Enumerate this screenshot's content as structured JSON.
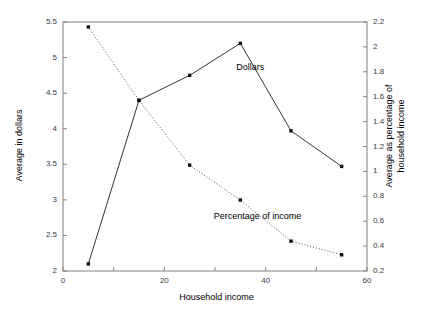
{
  "chart_data": {
    "type": "line",
    "title": "",
    "xlabel": "Household income",
    "ylabel": "Average in dollars",
    "ylabel_right": "Average as percentage of household income",
    "x": [
      5,
      15,
      25,
      35,
      45,
      55
    ],
    "xlim": [
      0,
      60
    ],
    "xticks": [
      0,
      20,
      40,
      60
    ],
    "xtick_labels": [
      "0",
      "20",
      "40",
      "60"
    ],
    "xminor_ticks": [
      10,
      30,
      50
    ],
    "ylim": [
      2,
      5.5
    ],
    "yticks": [
      2,
      2.5,
      3,
      3.5,
      4,
      4.5,
      5,
      5.5
    ],
    "ytick_labels": [
      "2",
      "2.5",
      "3",
      "3.5",
      "4",
      "4.5",
      "5",
      "5.5"
    ],
    "ylim_right": [
      0.2,
      2.2
    ],
    "yticks_right": [
      0.2,
      0.4,
      0.6,
      0.8,
      1,
      1.2,
      1.4,
      1.6,
      1.8,
      2,
      2.2
    ],
    "ytick_labels_right": [
      "0.2",
      "0.4",
      "0.6",
      "0.8",
      "1",
      "1.2",
      "1.4",
      "1.6",
      "1.8",
      "2",
      "2.2"
    ],
    "grid": false,
    "legend": "annotations",
    "series": [
      {
        "name": "Dollars",
        "axis": "left",
        "style": "solid",
        "marker": "square",
        "color": "#333333",
        "values": [
          2.1,
          4.4,
          4.75,
          5.2,
          3.97,
          3.47
        ]
      },
      {
        "name": "Percentage of income",
        "axis": "right",
        "style": "dotted",
        "marker": "square",
        "color": "#555555",
        "values": [
          2.16,
          1.57,
          1.05,
          0.77,
          0.44,
          0.33
        ]
      }
    ],
    "annotations": [
      {
        "text": "Dollars",
        "x": 34.2,
        "y": 4.85,
        "axis": "left"
      },
      {
        "text": "Percentage of income",
        "x": 29.5,
        "y": 0.63,
        "axis": "right"
      }
    ]
  }
}
